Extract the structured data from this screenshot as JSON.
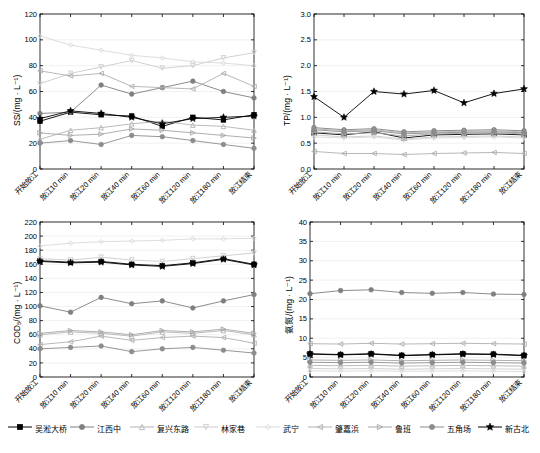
{
  "legend": {
    "items": [
      {
        "label": "吴淞大桥",
        "color": "#000000",
        "marker": "square-filled"
      },
      {
        "label": "江西中",
        "color": "#7f7f7f",
        "marker": "circle-filled"
      },
      {
        "label": "复兴东路",
        "color": "#b3b3b3",
        "marker": "triangle-up"
      },
      {
        "label": "林家巷",
        "color": "#cccccc",
        "marker": "triangle-down"
      },
      {
        "label": "武宁",
        "color": "#d9d9d9",
        "marker": "diamond"
      },
      {
        "label": "肇嘉浜",
        "color": "#b0b0b0",
        "marker": "triangle-left"
      },
      {
        "label": "鲁班",
        "color": "#a6a6a6",
        "marker": "triangle-right"
      },
      {
        "label": "五角场",
        "color": "#8c8c8c",
        "marker": "circle-filled"
      },
      {
        "label": "新古北",
        "color": "#000000",
        "marker": "star-filled"
      }
    ]
  },
  "chart_data": [
    {
      "type": "line",
      "title": "",
      "panel": "top-left",
      "ylabel": "SS/(mg · L⁻¹)",
      "xlabel": "",
      "ylim": [
        0,
        120
      ],
      "yticks": [
        0,
        20,
        40,
        60,
        80,
        100,
        120
      ],
      "categories": [
        "开始放江",
        "放江10 min",
        "放江20 min",
        "放江40 min",
        "放江60 min",
        "放江120 min",
        "放江180 min",
        "放江结束"
      ],
      "series": [
        {
          "name": "吴淞大桥",
          "color": "#000000",
          "values": [
            37,
            44,
            42,
            41,
            33,
            40,
            38,
            42
          ]
        },
        {
          "name": "江西中",
          "color": "#7f7f7f",
          "values": [
            43,
            44,
            65,
            58,
            63,
            68,
            60,
            55
          ]
        },
        {
          "name": "复兴东路",
          "color": "#b3b3b3",
          "values": [
            23,
            30,
            32,
            35,
            37,
            34,
            33,
            30
          ]
        },
        {
          "name": "林家巷",
          "color": "#cccccc",
          "values": [
            66,
            74,
            79,
            84,
            78,
            80,
            86,
            90
          ]
        },
        {
          "name": "武宁",
          "color": "#d9d9d9",
          "values": [
            103,
            96,
            92,
            88,
            86,
            83,
            82,
            80
          ]
        },
        {
          "name": "肇嘉浜",
          "color": "#b0b0b0",
          "values": [
            76,
            72,
            74,
            64,
            63,
            62,
            74,
            64
          ]
        },
        {
          "name": "鲁班",
          "color": "#a6a6a6",
          "values": [
            28,
            26,
            27,
            31,
            30,
            28,
            26,
            24
          ]
        },
        {
          "name": "五角场",
          "color": "#8c8c8c",
          "values": [
            20,
            22,
            19,
            26,
            25,
            22,
            19,
            16
          ]
        },
        {
          "name": "新古北",
          "color": "#000000",
          "values": [
            39,
            45,
            43,
            40,
            35,
            39,
            40,
            41
          ]
        }
      ]
    },
    {
      "type": "line",
      "title": "",
      "panel": "top-right",
      "ylabel": "TP/(mg · L⁻¹)",
      "xlabel": "",
      "ylim": [
        0.0,
        3.0
      ],
      "yticks": [
        0.0,
        0.5,
        1.0,
        1.5,
        2.0,
        2.5,
        3.0
      ],
      "categories": [
        "开始放江",
        "放江10 min",
        "放江20 min",
        "放江40 min",
        "放江60 min",
        "放江120 min",
        "放江180 min",
        "放江结束"
      ],
      "series": [
        {
          "name": "吴淞大桥",
          "color": "#000000",
          "values": [
            0.7,
            0.66,
            0.72,
            0.6,
            0.66,
            0.67,
            0.68,
            0.66
          ]
        },
        {
          "name": "江西中",
          "color": "#7f7f7f",
          "values": [
            0.8,
            0.76,
            0.78,
            0.72,
            0.74,
            0.75,
            0.76,
            0.74
          ]
        },
        {
          "name": "复兴东路",
          "color": "#b3b3b3",
          "values": [
            0.78,
            0.74,
            0.76,
            0.7,
            0.72,
            0.73,
            0.74,
            0.72
          ]
        },
        {
          "name": "林家巷",
          "color": "#cccccc",
          "values": [
            0.66,
            0.62,
            0.64,
            0.58,
            0.62,
            0.63,
            0.64,
            0.62
          ]
        },
        {
          "name": "武宁",
          "color": "#d9d9d9",
          "values": [
            0.62,
            0.6,
            0.62,
            0.56,
            0.6,
            0.61,
            0.62,
            0.6
          ]
        },
        {
          "name": "肇嘉浜",
          "color": "#b0b0b0",
          "values": [
            0.34,
            0.3,
            0.3,
            0.28,
            0.3,
            0.31,
            0.32,
            0.3
          ]
        },
        {
          "name": "鲁班",
          "color": "#a6a6a6",
          "values": [
            0.72,
            0.68,
            0.7,
            0.64,
            0.68,
            0.69,
            0.7,
            0.68
          ]
        },
        {
          "name": "五角场",
          "color": "#8c8c8c",
          "values": [
            0.76,
            0.72,
            0.74,
            0.68,
            0.7,
            0.71,
            0.72,
            0.7
          ]
        },
        {
          "name": "新古北",
          "color": "#000000",
          "values": [
            1.4,
            1.0,
            1.5,
            1.45,
            1.52,
            1.28,
            1.46,
            1.55
          ]
        }
      ]
    },
    {
      "type": "line",
      "title": "",
      "panel": "bottom-left",
      "ylabel": "COD₅/(mg · L⁻¹)",
      "xlabel": "",
      "ylim": [
        0,
        220
      ],
      "yticks": [
        0,
        20,
        40,
        60,
        80,
        100,
        120,
        140,
        160,
        180,
        200,
        220
      ],
      "categories": [
        "开始放江",
        "放江10 min",
        "放江20 min",
        "放江40 min",
        "放江60 min",
        "放江120 min",
        "放江180 min",
        "放江结束"
      ],
      "series": [
        {
          "name": "吴淞大桥",
          "color": "#000000",
          "values": [
            165,
            163,
            164,
            160,
            158,
            162,
            168,
            160
          ]
        },
        {
          "name": "江西中",
          "color": "#7f7f7f",
          "values": [
            101,
            92,
            113,
            104,
            108,
            98,
            108,
            117
          ]
        },
        {
          "name": "复兴东路",
          "color": "#b3b3b3",
          "values": [
            60,
            64,
            62,
            58,
            64,
            62,
            66,
            60
          ]
        },
        {
          "name": "林家巷",
          "color": "#cccccc",
          "values": [
            168,
            166,
            170,
            166,
            164,
            168,
            172,
            176
          ]
        },
        {
          "name": "武宁",
          "color": "#d9d9d9",
          "values": [
            186,
            190,
            192,
            193,
            194,
            196,
            196,
            197
          ]
        },
        {
          "name": "肇嘉浜",
          "color": "#b0b0b0",
          "values": [
            46,
            50,
            58,
            52,
            56,
            58,
            56,
            48
          ]
        },
        {
          "name": "鲁班",
          "color": "#a6a6a6",
          "values": [
            62,
            66,
            64,
            60,
            66,
            64,
            68,
            62
          ]
        },
        {
          "name": "五角场",
          "color": "#8c8c8c",
          "values": [
            40,
            42,
            44,
            36,
            40,
            42,
            38,
            34
          ]
        },
        {
          "name": "新古北",
          "color": "#000000",
          "values": [
            164,
            162,
            163,
            159,
            157,
            161,
            167,
            159
          ]
        }
      ]
    },
    {
      "type": "line",
      "title": "",
      "panel": "bottom-right",
      "ylabel": "氨氮/(mg · L⁻¹)",
      "xlabel": "",
      "ylim": [
        0,
        40
      ],
      "yticks": [
        0,
        5,
        10,
        15,
        20,
        25,
        30,
        35,
        40
      ],
      "categories": [
        "开始放江",
        "放江10 min",
        "放江20 min",
        "放江40 min",
        "放江60 min",
        "放江120 min",
        "放江180 min",
        "放江结束"
      ],
      "series": [
        {
          "name": "吴淞大桥",
          "color": "#000000",
          "values": [
            6.0,
            5.8,
            6.0,
            5.6,
            5.8,
            6.0,
            5.9,
            5.6
          ]
        },
        {
          "name": "江西中",
          "color": "#7f7f7f",
          "values": [
            21.5,
            22.3,
            22.5,
            21.8,
            21.6,
            21.8,
            21.4,
            21.3
          ]
        },
        {
          "name": "复兴东路",
          "color": "#b3b3b3",
          "values": [
            3.0,
            2.9,
            3.0,
            2.8,
            2.9,
            3.0,
            2.9,
            2.8
          ]
        },
        {
          "name": "林家巷",
          "color": "#cccccc",
          "values": [
            2.2,
            2.1,
            2.2,
            2.0,
            2.1,
            2.2,
            2.1,
            2.0
          ]
        },
        {
          "name": "武宁",
          "color": "#d9d9d9",
          "values": [
            1.6,
            1.5,
            1.6,
            1.5,
            1.5,
            1.6,
            1.5,
            1.4
          ]
        },
        {
          "name": "肇嘉浜",
          "color": "#b0b0b0",
          "values": [
            8.6,
            8.5,
            8.7,
            8.5,
            8.6,
            8.7,
            8.6,
            8.5
          ]
        },
        {
          "name": "鲁班",
          "color": "#a6a6a6",
          "values": [
            4.4,
            4.3,
            4.4,
            4.2,
            4.3,
            4.4,
            4.3,
            4.2
          ]
        },
        {
          "name": "五角场",
          "color": "#8c8c8c",
          "values": [
            3.8,
            3.7,
            3.8,
            3.6,
            3.7,
            3.8,
            3.7,
            3.6
          ]
        },
        {
          "name": "新古北",
          "color": "#000000",
          "values": [
            5.9,
            5.7,
            5.9,
            5.5,
            5.7,
            5.9,
            5.8,
            5.5
          ]
        }
      ]
    }
  ]
}
